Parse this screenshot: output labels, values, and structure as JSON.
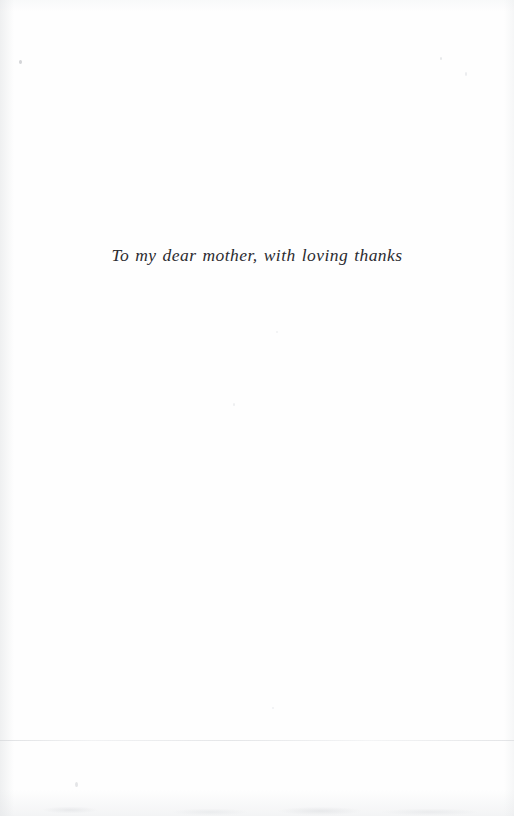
{
  "page": {
    "kind": "book-dedication-page",
    "width": 514,
    "height": 816,
    "background_color": "#fefefe",
    "text_color": "#2b2b30"
  },
  "dedication": {
    "text": "To my dear mother, with loving thanks",
    "style": "italic",
    "alignment": "center"
  },
  "artifacts": {
    "specks": [
      "speck-a",
      "speck-b",
      "speck-c",
      "speck-d",
      "speck-e",
      "speck-f",
      "speck-g"
    ],
    "seam_label": "scan-seam"
  }
}
